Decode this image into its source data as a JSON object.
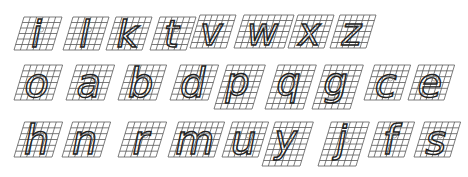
{
  "diagram": {
    "colors": {
      "grid": "#5a5a5a",
      "stroke": "#222222",
      "note": "#777777",
      "background": "#ffffff"
    },
    "rows": [
      {
        "name": "row-1",
        "letters": [
          {
            "char": "i",
            "x": 14,
            "y": 17,
            "w": 38,
            "h": 33,
            "cols": 6,
            "rows": 6
          },
          {
            "char": "l",
            "x": 63,
            "y": 17,
            "w": 36,
            "h": 33,
            "cols": 6,
            "rows": 6
          },
          {
            "char": "k",
            "x": 106,
            "y": 17,
            "w": 36,
            "h": 33,
            "cols": 6,
            "rows": 6
          },
          {
            "char": "t",
            "x": 150,
            "y": 17,
            "w": 36,
            "h": 33,
            "cols": 6,
            "rows": 6
          },
          {
            "char": "v",
            "x": 190,
            "y": 15,
            "w": 36,
            "h": 33,
            "cols": 6,
            "rows": 6
          },
          {
            "char": "w",
            "x": 234,
            "y": 15,
            "w": 50,
            "h": 33,
            "cols": 8,
            "rows": 6
          },
          {
            "char": "x",
            "x": 288,
            "y": 15,
            "w": 36,
            "h": 33,
            "cols": 6,
            "rows": 6
          },
          {
            "char": "z",
            "x": 330,
            "y": 15,
            "w": 36,
            "h": 33,
            "cols": 6,
            "rows": 6
          }
        ]
      },
      {
        "name": "row-2",
        "letters": [
          {
            "char": "o",
            "x": 14,
            "y": 65,
            "w": 38,
            "h": 35,
            "cols": 6,
            "rows": 6
          },
          {
            "char": "a",
            "x": 66,
            "y": 65,
            "w": 38,
            "h": 35,
            "cols": 6,
            "rows": 6
          },
          {
            "char": "b",
            "x": 118,
            "y": 65,
            "w": 38,
            "h": 35,
            "cols": 6,
            "rows": 6
          },
          {
            "char": "d",
            "x": 170,
            "y": 65,
            "w": 38,
            "h": 35,
            "cols": 6,
            "rows": 6
          },
          {
            "char": "p",
            "x": 214,
            "y": 65,
            "w": 38,
            "h": 44,
            "cols": 6,
            "rows": 8
          },
          {
            "char": "q",
            "x": 265,
            "y": 65,
            "w": 38,
            "h": 44,
            "cols": 6,
            "rows": 8
          },
          {
            "char": "g",
            "x": 312,
            "y": 65,
            "w": 38,
            "h": 44,
            "cols": 6,
            "rows": 8
          },
          {
            "char": "c",
            "x": 364,
            "y": 65,
            "w": 36,
            "h": 35,
            "cols": 6,
            "rows": 6
          },
          {
            "char": "e",
            "x": 408,
            "y": 65,
            "w": 36,
            "h": 35,
            "cols": 6,
            "rows": 6
          }
        ]
      },
      {
        "name": "row-3",
        "letters": [
          {
            "char": "h",
            "x": 14,
            "y": 122,
            "w": 38,
            "h": 35,
            "cols": 6,
            "rows": 6
          },
          {
            "char": "n",
            "x": 62,
            "y": 122,
            "w": 38,
            "h": 35,
            "cols": 6,
            "rows": 6
          },
          {
            "char": "r",
            "x": 118,
            "y": 122,
            "w": 38,
            "h": 35,
            "cols": 6,
            "rows": 6
          },
          {
            "char": "m",
            "x": 168,
            "y": 122,
            "w": 46,
            "h": 35,
            "cols": 8,
            "rows": 6
          },
          {
            "char": "u",
            "x": 222,
            "y": 122,
            "w": 36,
            "h": 35,
            "cols": 6,
            "rows": 6
          },
          {
            "char": "y",
            "x": 262,
            "y": 122,
            "w": 38,
            "h": 44,
            "cols": 6,
            "rows": 8
          },
          {
            "char": "j",
            "x": 318,
            "y": 122,
            "w": 38,
            "h": 44,
            "cols": 6,
            "rows": 8
          },
          {
            "char": "f",
            "x": 368,
            "y": 122,
            "w": 36,
            "h": 35,
            "cols": 6,
            "rows": 6
          },
          {
            "char": "s",
            "x": 414,
            "y": 122,
            "w": 36,
            "h": 35,
            "cols": 6,
            "rows": 6
          }
        ]
      }
    ],
    "skew": 10
  }
}
